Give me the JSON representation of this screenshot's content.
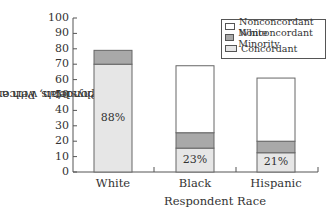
{
  "chart_data": {
    "type": "bar",
    "stacked": true,
    "title": "",
    "xlabel": "Respondent Race",
    "ylabel": "Respondents with a Regular Physician, Percentage",
    "ylabel_lines": [
      "Respondents with a Regular",
      "Physician, Percentage"
    ],
    "ylim": [
      0,
      100
    ],
    "yticks": [
      0,
      10,
      20,
      30,
      40,
      50,
      60,
      70,
      80,
      90,
      100
    ],
    "categories": [
      "White",
      "Black",
      "Hispanic"
    ],
    "series": [
      {
        "name": "Concordant",
        "color": "#e6e6e6",
        "values": [
          70,
          15.5,
          12.5
        ]
      },
      {
        "name": "Nonconcordant Minority",
        "color": "#a9a9a9",
        "values": [
          9,
          10,
          7.5
        ]
      },
      {
        "name": "Nonconcordant White",
        "color": "#ffffff",
        "values": [
          0,
          43.5,
          41
        ]
      }
    ],
    "totals": [
      79,
      69,
      61
    ],
    "annotations": [
      "88%",
      "23%",
      "21%"
    ],
    "legend": {
      "position": "top-right",
      "entries": [
        "Nonconcordant White",
        "Nonconcordant Minority",
        "Concordant"
      ]
    },
    "grid": false
  }
}
